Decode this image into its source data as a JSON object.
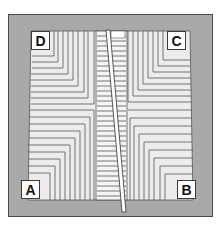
{
  "diagram": {
    "corner_labels": {
      "top_left": "D",
      "top_right": "C",
      "bottom_left": "A",
      "bottom_right": "B"
    },
    "colors": {
      "frame_fill": "#a9a9a9",
      "frame_border": "#4a4a4a",
      "board_fill": "#ececec",
      "board_line": "#555555",
      "label_fill": "#ffffff"
    }
  }
}
